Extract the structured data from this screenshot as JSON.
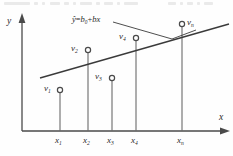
{
  "figure": {
    "caption_fragment_top": "",
    "axes": {
      "y_label": "y",
      "x_label": "x"
    },
    "equation": {
      "text": "ŷ=b0+bx",
      "y_hat": "ŷ",
      "equals": "=",
      "intercept": "b",
      "intercept_sub": "0",
      "plus": "+",
      "slope": "b",
      "variable": "x"
    },
    "line_color": "#3a3a3a",
    "axis_color": "#4a4a4a",
    "marker_color": "#4a4a4a",
    "text_color": "#2b2b2b",
    "points": [
      {
        "name": "v",
        "sub": "1",
        "x_tick": "x1",
        "cx": 60,
        "cy": 90,
        "label_x": 44,
        "label_y": 85,
        "stem_top": 90
      },
      {
        "name": "v",
        "sub": "2",
        "x_tick": "x2",
        "cx": 88,
        "cy": 50,
        "label_x": 70,
        "label_y": 45,
        "stem_top": 50
      },
      {
        "name": "v",
        "sub": "3",
        "x_tick": "x3",
        "cx": 112,
        "cy": 78,
        "label_x": 95,
        "label_y": 73,
        "stem_top": 78
      },
      {
        "name": "v",
        "sub": "4",
        "x_tick": "x4",
        "cx": 136,
        "cy": 38,
        "label_x": 119,
        "label_y": 33,
        "stem_top": 38
      },
      {
        "name": "v",
        "sub": "n",
        "x_tick": "xn",
        "cx": 182,
        "cy": 24,
        "label_x": 188,
        "label_y": 19,
        "stem_top": 24
      }
    ],
    "x_ticks": [
      {
        "label": "x",
        "sub": "1",
        "x": 60
      },
      {
        "label": "x",
        "sub": "2",
        "x": 88
      },
      {
        "label": "x",
        "sub": "3",
        "x": 112
      },
      {
        "label": "x",
        "sub": "4",
        "x": 136
      },
      {
        "label": "x",
        "sub": "n",
        "x": 182
      }
    ],
    "regression_line": {
      "x1": 40,
      "y1": 78,
      "x2": 229,
      "y2": 24
    },
    "leader": {
      "from_x": 113,
      "from_y": 22,
      "vertex_x": 172,
      "vertex_y": 39,
      "to_x": 196,
      "to_y": 30
    }
  }
}
